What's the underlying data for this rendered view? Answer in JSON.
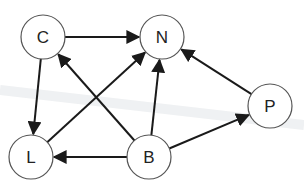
{
  "diagram": {
    "type": "directed-graph",
    "nodes": [
      {
        "id": "C",
        "label": "C",
        "x": 43,
        "y": 37
      },
      {
        "id": "N",
        "label": "N",
        "x": 162,
        "y": 37
      },
      {
        "id": "P",
        "label": "P",
        "x": 270,
        "y": 106
      },
      {
        "id": "L",
        "label": "L",
        "x": 31,
        "y": 157
      },
      {
        "id": "B",
        "label": "B",
        "x": 149,
        "y": 157
      }
    ],
    "edges": [
      {
        "from": "C",
        "to": "N"
      },
      {
        "from": "C",
        "to": "L"
      },
      {
        "from": "B",
        "to": "C"
      },
      {
        "from": "L",
        "to": "N"
      },
      {
        "from": "B",
        "to": "N"
      },
      {
        "from": "B",
        "to": "L"
      },
      {
        "from": "B",
        "to": "P"
      },
      {
        "from": "P",
        "to": "N"
      }
    ],
    "colors": {
      "edge": "#1a1a1a",
      "node_stroke": "#555555",
      "background": "#ffffff"
    }
  }
}
